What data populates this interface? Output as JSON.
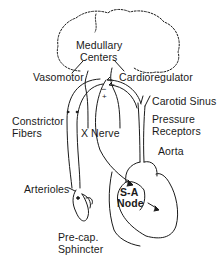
{
  "diagram": {
    "title_labels": {
      "medullary_centers": [
        "Medullary",
        "Centers"
      ],
      "vasomotor": "Vasomotor",
      "cardioregulator": "Cardioregulator",
      "carotid_sinus": "Carotid Sinus",
      "pressure_receptors": [
        "Pressure",
        "Receptors"
      ],
      "constrictor_fibers": [
        "Constrictor",
        "Fibers"
      ],
      "nerve": "X Nerve",
      "aorta": "Aorta",
      "arterioles": "Arterioles",
      "sa_node": [
        "S-A",
        "Node"
      ],
      "pre_cap_sphincter": [
        "Pre-cap.",
        "Sphincter"
      ]
    },
    "signs": {
      "minus": "−",
      "plus": "+"
    },
    "colors": {
      "ink": "#1a1a1a",
      "background": "#ffffff"
    }
  }
}
